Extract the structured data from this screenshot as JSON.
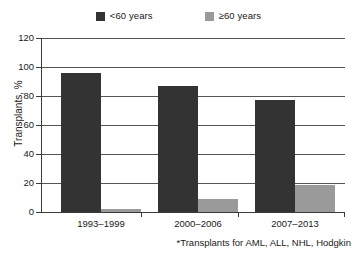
{
  "chart_data": {
    "type": "bar",
    "title": "",
    "subtitle": "",
    "xlabel": "",
    "ylabel": "Transplants, %",
    "categories": [
      "1993–1999",
      "2000–2006",
      "2007–2013"
    ],
    "series": [
      {
        "name": "<60 years",
        "values": [
          96,
          87,
          77
        ],
        "color": "#333333"
      },
      {
        "name": "≥60 years",
        "values": [
          1.5,
          9,
          18
        ],
        "color": "#9a9a9a"
      }
    ],
    "ylim": [
      0,
      120
    ],
    "yticks": [
      0,
      20,
      40,
      60,
      80,
      100,
      120
    ],
    "ytick_labels": [
      "0",
      "20",
      "40",
      "60",
      "80",
      "100",
      "120"
    ],
    "grid": "horizontal",
    "legend_position": "top-center",
    "annotations": [
      "*Transplants for AML, ALL, NHL, Hodgkin"
    ]
  },
  "legend": {
    "items": [
      {
        "label": "<60 years",
        "color": "#333333",
        "swatch_icon": "square-swatch-icon"
      },
      {
        "label": "≥60 years",
        "color": "#9a9a9a",
        "swatch_icon": "square-swatch-icon"
      }
    ]
  },
  "axes": {
    "y_title": "Transplants, %",
    "y_ticks": [
      "120",
      "100",
      "80",
      "60",
      "40",
      "20",
      "0"
    ],
    "x_ticks": [
      "1993–1999",
      "2000–2006",
      "2007–2013"
    ]
  },
  "footnote": "*Transplants for AML, ALL, NHL, Hodgkin",
  "colors": {
    "series_young": "#333333",
    "series_old": "#9a9a9a",
    "axis": "#3a3a3a",
    "grid": "#555555",
    "background": "#ffffff",
    "text": "#1a1a1a"
  }
}
